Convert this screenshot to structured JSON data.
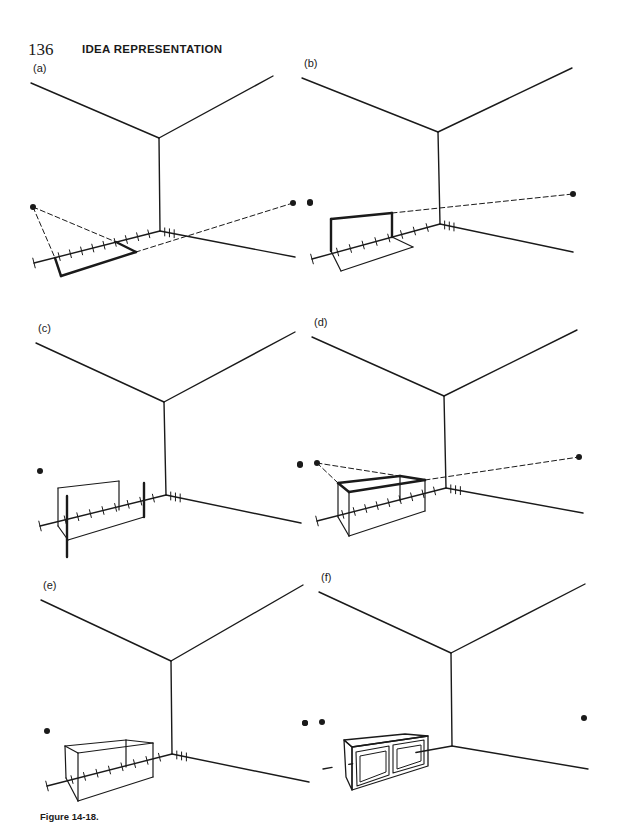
{
  "header": {
    "page_number": "136",
    "running_head": "IDEA REPRESENTATION"
  },
  "caption": "Figure 14-18.",
  "panels": [
    {
      "label": "(a)",
      "corner": [
        159,
        138
      ],
      "floor": [
        160,
        231
      ],
      "ceil_left": [
        31,
        83
      ],
      "ceil_right": [
        273,
        76
      ],
      "floor_left": [
        34,
        263
      ],
      "floor_right": [
        295,
        257
      ],
      "dots": [
        [
          33,
          207
        ],
        [
          293,
          203
        ],
        [
          310,
          203
        ]
      ],
      "dashed": [
        [
          [
            33,
            207
          ],
          [
            55,
            258
          ]
        ],
        [
          [
            33,
            207
          ],
          [
            116,
            242
          ]
        ],
        [
          [
            293,
            203
          ],
          [
            136,
            252
          ]
        ]
      ],
      "heavy": [
        [
          [
            55,
            258
          ],
          [
            61,
            276
          ]
        ],
        [
          [
            61,
            276
          ],
          [
            136,
            252
          ]
        ],
        [
          [
            136,
            252
          ],
          [
            116,
            242
          ]
        ]
      ],
      "thin": [],
      "ticks_left": 9,
      "ticks_right": 3
    },
    {
      "label": "(b)",
      "corner": [
        438,
        132
      ],
      "floor": [
        440,
        224
      ],
      "ceil_left": [
        302,
        78
      ],
      "ceil_right": [
        572,
        68
      ],
      "floor_left": [
        312,
        259
      ],
      "floor_right": [
        573,
        252
      ],
      "dots": [
        [
          310,
          202
        ],
        [
          573,
          194
        ]
      ],
      "dashed": [
        [
          [
            392,
            213
          ],
          [
            573,
            194
          ]
        ]
      ],
      "heavy": [
        [
          [
            331,
            251
          ],
          [
            331,
            219
          ]
        ],
        [
          [
            331,
            219
          ],
          [
            392,
            213
          ]
        ],
        [
          [
            392,
            213
          ],
          [
            392,
            237
          ]
        ]
      ],
      "thin": [
        [
          [
            331,
            251
          ],
          [
            341,
            271
          ]
        ],
        [
          [
            341,
            271
          ],
          [
            413,
            247
          ]
        ],
        [
          [
            413,
            247
          ],
          [
            392,
            237
          ]
        ]
      ],
      "ticks_left": 8,
      "ticks_right": 3
    },
    {
      "label": "(c)",
      "corner": [
        164,
        402
      ],
      "floor": [
        166,
        495
      ],
      "ceil_left": [
        36,
        343
      ],
      "ceil_right": [
        295,
        332
      ],
      "floor_left": [
        40,
        526
      ],
      "floor_right": [
        301,
        523
      ],
      "dots": [
        [
          40,
          471
        ],
        [
          300,
          465
        ]
      ],
      "dashed": [],
      "heavy": [
        [
          [
            67,
            557
          ],
          [
            67,
            496
          ]
        ],
        [
          [
            144,
            517
          ],
          [
            144,
            483
          ]
        ]
      ],
      "thin": [
        [
          [
            58,
            526
          ],
          [
            58,
            488
          ]
        ],
        [
          [
            58,
            488
          ],
          [
            119,
            481
          ]
        ],
        [
          [
            119,
            481
          ],
          [
            119,
            510
          ]
        ],
        [
          [
            58,
            526
          ],
          [
            68,
            540
          ]
        ],
        [
          [
            68,
            540
          ],
          [
            144,
            517
          ]
        ]
      ],
      "ticks_left": 8,
      "ticks_right": 3
    },
    {
      "label": "(d)",
      "corner": [
        444,
        396
      ],
      "floor": [
        446,
        488
      ],
      "ceil_left": [
        312,
        337
      ],
      "ceil_right": [
        577,
        330
      ],
      "floor_left": [
        317,
        521
      ],
      "floor_right": [
        583,
        513
      ],
      "dots": [
        [
          300,
          464
        ],
        [
          317,
          463
        ],
        [
          579,
          457
        ]
      ],
      "dashed": [
        [
          [
            317,
            463
          ],
          [
            338,
            483
          ]
        ],
        [
          [
            317,
            463
          ],
          [
            425,
            480
          ]
        ],
        [
          [
            425,
            480
          ],
          [
            579,
            457
          ]
        ]
      ],
      "heavy": [
        [
          [
            338,
            483
          ],
          [
            349,
            492
          ]
        ],
        [
          [
            349,
            492
          ],
          [
            425,
            480
          ]
        ],
        [
          [
            425,
            480
          ],
          [
            400,
            476
          ]
        ],
        [
          [
            400,
            476
          ],
          [
            338,
            483
          ]
        ]
      ],
      "thin": [
        [
          [
            338,
            483
          ],
          [
            338,
            517
          ]
        ],
        [
          [
            349,
            492
          ],
          [
            349,
            536
          ]
        ],
        [
          [
            400,
            476
          ],
          [
            400,
            501
          ]
        ],
        [
          [
            425,
            480
          ],
          [
            425,
            511
          ]
        ],
        [
          [
            338,
            517
          ],
          [
            349,
            536
          ]
        ],
        [
          [
            349,
            536
          ],
          [
            425,
            511
          ]
        ]
      ],
      "ticks_left": 9,
      "ticks_right": 3
    },
    {
      "label": "(e)",
      "corner": [
        171,
        661
      ],
      "floor": [
        172,
        754
      ],
      "ceil_left": [
        41,
        600
      ],
      "ceil_right": [
        303,
        585
      ],
      "floor_left": [
        47,
        786
      ],
      "floor_right": [
        309,
        782
      ],
      "dots": [
        [
          47,
          731
        ],
        [
          305,
          723
        ]
      ],
      "dashed": [],
      "heavy": [],
      "thin": [
        [
          [
            65,
            746
          ],
          [
            126,
            740
          ]
        ],
        [
          [
            126,
            740
          ],
          [
            153,
            743
          ]
        ],
        [
          [
            153,
            743
          ],
          [
            78,
            753
          ]
        ],
        [
          [
            78,
            753
          ],
          [
            65,
            746
          ]
        ],
        [
          [
            65,
            746
          ],
          [
            66,
            778
          ]
        ],
        [
          [
            78,
            753
          ],
          [
            78,
            801
          ]
        ],
        [
          [
            126,
            740
          ],
          [
            126,
            767
          ]
        ],
        [
          [
            153,
            743
          ],
          [
            153,
            777
          ]
        ],
        [
          [
            66,
            778
          ],
          [
            78,
            801
          ]
        ],
        [
          [
            78,
            801
          ],
          [
            153,
            777
          ]
        ]
      ],
      "ticks_left": 8,
      "ticks_right": 3
    },
    {
      "label": "(f)",
      "corner": [
        451,
        653
      ],
      "floor": [
        452,
        746
      ],
      "ceil_left": [
        319,
        592
      ],
      "ceil_right": [
        585,
        584
      ],
      "floor_left": [
        323,
        769
      ],
      "floor_right": [
        588,
        769
      ],
      "dots": [
        [
          305,
          723
        ],
        [
          322,
          722
        ],
        [
          584,
          718
        ]
      ],
      "dashed": [],
      "heavy": [],
      "thin": [],
      "cabinet": true,
      "ticks_left": 0,
      "ticks_right": 0
    }
  ]
}
